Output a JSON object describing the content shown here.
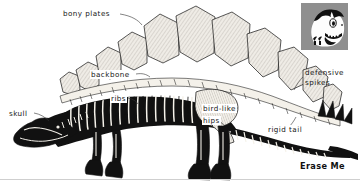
{
  "page": {
    "width": 360,
    "height": 187,
    "background_color": "#ffffff",
    "ink_color": "#111111"
  },
  "diagram": {
    "style": "black-and-white line engraving",
    "labels": [
      {
        "id": "bony-plates",
        "text": "bony plates",
        "x": 62,
        "y": 9,
        "leader": true
      },
      {
        "id": "backbone",
        "text": "backbone",
        "x": 90,
        "y": 70,
        "leader": true
      },
      {
        "id": "ribs",
        "text": "ribs",
        "x": 110,
        "y": 94,
        "leader": true
      },
      {
        "id": "skull",
        "text": "skull",
        "x": 9,
        "y": 109,
        "leader": true
      },
      {
        "id": "bird-like-hips",
        "text": "bird-like",
        "x": 202,
        "y": 104,
        "leader": true
      },
      {
        "id": "hips",
        "text": "hips",
        "x": 202,
        "y": 116,
        "leader": false
      },
      {
        "id": "rigid-tail",
        "text": "rigid tail",
        "x": 267,
        "y": 125,
        "leader": true
      },
      {
        "id": "defensive",
        "text": "defensive",
        "x": 305,
        "y": 68,
        "leader": true
      },
      {
        "id": "spikes",
        "text": "spikes",
        "x": 305,
        "y": 78,
        "leader": false
      }
    ]
  },
  "inset": {
    "id": "dinosaur-head-thumbnail",
    "description": "cartoon dinosaur head",
    "background_color": "#8f8f8f",
    "x": 301,
    "y": 3,
    "width": 47,
    "height": 47
  },
  "annotations": {
    "erase_me": "Erase Me"
  },
  "divider": {
    "color": "#cfcfcf",
    "y": 179
  }
}
